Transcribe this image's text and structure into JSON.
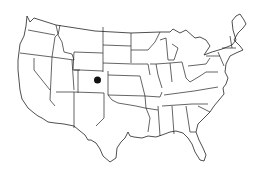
{
  "map": {
    "title": "",
    "region": "Contiguous United States",
    "style": "outline map with state borders",
    "colors": {
      "background": "#ffffff",
      "stroke": "#222222",
      "marker": "#111111"
    },
    "markers": [
      {
        "name": "location-marker",
        "state": "Colorado",
        "x": 97.5,
        "y": 80,
        "radius": 3.5
      }
    ]
  }
}
